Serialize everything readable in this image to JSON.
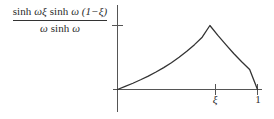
{
  "figure": {
    "background_color": "#ffffff",
    "ink_color": "#333333",
    "width": 274,
    "height": 119
  },
  "formula": {
    "numerator": "sinh ωξ sinh ω (1−ξ)",
    "denominator": "ω sinh ω",
    "numerator_parts": {
      "sinh_1": "sinh",
      "omega_xi": "ωξ",
      "sinh_2": "sinh",
      "omega": "ω",
      "one_minus_xi": "(1−ξ)"
    },
    "denominator_parts": {
      "omega": "ω",
      "sinh": "sinh",
      "omega_2": "ω"
    }
  },
  "axes": {
    "x_axis_label": "",
    "y_axis_label": "",
    "x_ticks": [
      {
        "label": "ξ",
        "value": 0.66
      },
      {
        "label": "1",
        "value": 1.0
      }
    ],
    "y_ticks": [
      {
        "label": "",
        "value": 1.0
      }
    ]
  },
  "chart_data": {
    "type": "line",
    "title": "",
    "xlabel": "",
    "ylabel": "sinh ωξ sinh ω (1−ξ) / ω sinh ω",
    "xlim": [
      0,
      1.05
    ],
    "ylim": [
      0,
      1.1
    ],
    "grid": false,
    "legend": "none",
    "annotations": [
      {
        "text": "ξ",
        "x": 0.66,
        "y": 0
      },
      {
        "text": "1",
        "x": 1.0,
        "y": 0
      }
    ],
    "series": [
      {
        "name": "Green's function G(x, ξ)",
        "x": [
          0.0,
          0.055,
          0.11,
          0.165,
          0.22,
          0.275,
          0.33,
          0.385,
          0.44,
          0.495,
          0.55,
          0.605,
          0.66,
          0.717,
          0.774,
          0.83,
          0.887,
          0.944,
          1.0
        ],
        "y": [
          0.0,
          0.048,
          0.098,
          0.152,
          0.21,
          0.273,
          0.342,
          0.418,
          0.503,
          0.597,
          0.701,
          0.817,
          1.0,
          0.845,
          0.7,
          0.563,
          0.434,
          0.313,
          0.0
        ]
      }
    ]
  }
}
